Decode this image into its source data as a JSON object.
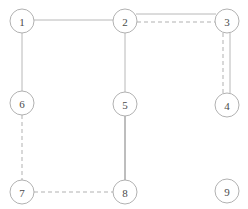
{
  "diagram": {
    "type": "node-link-graph",
    "canvas": {
      "width": 248,
      "height": 209,
      "background": "#ffffff"
    },
    "style": {
      "node_fill": "#ffffff",
      "node_stroke": "#a8a8a8",
      "node_radius": 12,
      "label_color": "#4a4a4a",
      "edge_solid_color": "#b0b0b0",
      "edge_solid_dark_color": "#7d7d7d",
      "edge_dashed_color": "#a8a8a8"
    },
    "nodes": [
      {
        "id": "1",
        "label": "1",
        "cx": 22,
        "cy": 21,
        "r": 12
      },
      {
        "id": "2",
        "label": "2",
        "cx": 125,
        "cy": 21,
        "r": 12
      },
      {
        "id": "3",
        "label": "3",
        "cx": 227,
        "cy": 21,
        "r": 12
      },
      {
        "id": "4",
        "label": "4",
        "cx": 227,
        "cy": 105,
        "r": 12
      },
      {
        "id": "5",
        "label": "5",
        "cx": 125,
        "cy": 104,
        "r": 12
      },
      {
        "id": "6",
        "label": "6",
        "cx": 22,
        "cy": 103,
        "r": 12
      },
      {
        "id": "7",
        "label": "7",
        "cx": 22,
        "cy": 192,
        "r": 12
      },
      {
        "id": "8",
        "label": "8",
        "cx": 125,
        "cy": 192,
        "r": 12
      },
      {
        "id": "9",
        "label": "9",
        "cx": 227,
        "cy": 191,
        "r": 12
      }
    ],
    "edges": [
      {
        "id": "e-1-2",
        "from": "1",
        "to": "2",
        "style": "solid",
        "x1": 34,
        "y1": 20,
        "x2": 113,
        "y2": 20,
        "offset": 0
      },
      {
        "id": "e-1-6",
        "from": "1",
        "to": "6",
        "style": "solid",
        "x1": 22,
        "y1": 33,
        "x2": 22,
        "y2": 91,
        "offset": 0
      },
      {
        "id": "e-2-5",
        "from": "2",
        "to": "5",
        "style": "solid",
        "x1": 125,
        "y1": 33,
        "x2": 125,
        "y2": 92,
        "offset": 0
      },
      {
        "id": "e-2-3a",
        "from": "2",
        "to": "3",
        "style": "solid",
        "x1": 136,
        "y1": 14,
        "x2": 216,
        "y2": 14,
        "offset": -7
      },
      {
        "id": "e-2-3b",
        "from": "2",
        "to": "3",
        "style": "dashed",
        "x1": 137,
        "y1": 22,
        "x2": 215,
        "y2": 22,
        "offset": 1
      },
      {
        "id": "e-3-4a",
        "from": "3",
        "to": "4",
        "style": "dashed",
        "x1": 223,
        "y1": 33,
        "x2": 223,
        "y2": 93,
        "offset": -4
      },
      {
        "id": "e-3-4b",
        "from": "3",
        "to": "4",
        "style": "solid",
        "x1": 230,
        "y1": 33,
        "x2": 230,
        "y2": 93,
        "offset": 3
      },
      {
        "id": "e-5-8",
        "from": "5",
        "to": "8",
        "style": "solid-dark",
        "x1": 125,
        "y1": 116,
        "x2": 125,
        "y2": 180,
        "offset": 0
      },
      {
        "id": "e-6-7",
        "from": "6",
        "to": "7",
        "style": "dashed",
        "x1": 22,
        "y1": 115,
        "x2": 22,
        "y2": 180,
        "offset": 0
      },
      {
        "id": "e-7-8",
        "from": "7",
        "to": "8",
        "style": "dashed",
        "x1": 34,
        "y1": 192,
        "x2": 113,
        "y2": 192,
        "offset": 0
      }
    ],
    "isolated_nodes": [
      "9"
    ]
  }
}
